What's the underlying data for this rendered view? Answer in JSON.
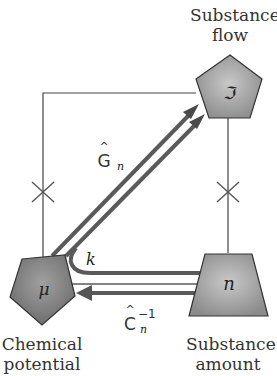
{
  "nodes": {
    "substance_flow": {
      "label_line1": "Substance",
      "label_line2": "flow",
      "symbol": "ℑ",
      "shape": "pentagon"
    },
    "chemical_potential": {
      "label_line1": "Chemical",
      "label_line2": "potential",
      "symbol": "μ",
      "shape": "pentagon"
    },
    "substance_amount": {
      "label_line1": "Substance",
      "label_line2": "amount",
      "symbol": "n",
      "shape": "trapezoid"
    }
  },
  "edges": {
    "G_hat_n": {
      "base": "G",
      "hat": "^",
      "sub": "n"
    },
    "k": {
      "label": "k"
    },
    "C_hat_n_inv": {
      "base": "C",
      "hat": "^",
      "sup": "−1",
      "sub": "n"
    }
  },
  "colors": {
    "node_fill": "#9a9a9a",
    "arrow": "#5a5a5a",
    "line": "#444444"
  }
}
